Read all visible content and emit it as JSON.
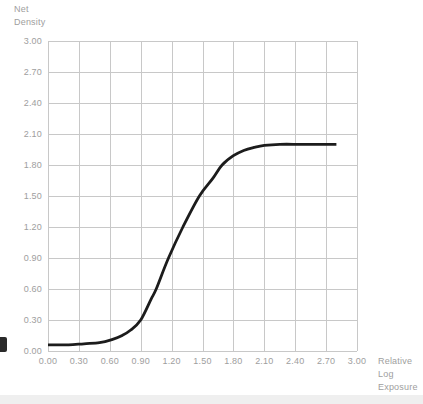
{
  "figure": {
    "background": "#ffffff"
  },
  "chart_data": {
    "type": "line",
    "title": "",
    "ylabel": "Net Density",
    "ylabel_display": "Net\nDensity",
    "xlabel": "Relative Log Exposure",
    "xlabel_display": "Relative\nLog\nExposure",
    "xlim": [
      0.0,
      3.0
    ],
    "ylim": [
      0.0,
      3.0
    ],
    "grid": true,
    "legend": false,
    "x_tick_labels": [
      "0.00",
      "0.30",
      "0.60",
      "0.90",
      "1.20",
      "1.50",
      "1.80",
      "2.10",
      "2.40",
      "2.70",
      "3.00"
    ],
    "x_tick_values": [
      0.0,
      0.3,
      0.6,
      0.9,
      1.2,
      1.5,
      1.8,
      2.1,
      2.4,
      2.7,
      3.0
    ],
    "y_tick_labels": [
      "0.00",
      "0.30",
      "0.60",
      "0.90",
      "1.20",
      "1.50",
      "1.80",
      "2.10",
      "2.40",
      "2.70",
      "3.00"
    ],
    "y_tick_values": [
      0.0,
      0.3,
      0.6,
      0.9,
      1.2,
      1.5,
      1.8,
      2.1,
      2.4,
      2.7,
      3.0
    ],
    "series": [
      {
        "name": "characteristic-curve",
        "color": "#1c1c1c",
        "x": [
          0.0,
          0.2,
          0.35,
          0.5,
          0.62,
          0.72,
          0.8,
          0.9,
          1.0,
          1.05,
          1.17,
          1.31,
          1.47,
          1.6,
          1.69,
          1.8,
          1.9,
          2.0,
          2.1,
          2.25,
          2.45,
          2.65,
          2.8
        ],
        "y": [
          0.06,
          0.06,
          0.07,
          0.08,
          0.11,
          0.15,
          0.2,
          0.3,
          0.5,
          0.6,
          0.9,
          1.2,
          1.5,
          1.67,
          1.8,
          1.89,
          1.94,
          1.97,
          1.99,
          2.0,
          2.0,
          2.0,
          2.0
        ]
      }
    ],
    "colors": {
      "grid": "#c8c8c8",
      "labels": "#9e9e9e",
      "curve": "#1c1c1c",
      "background": "#ffffff"
    }
  }
}
